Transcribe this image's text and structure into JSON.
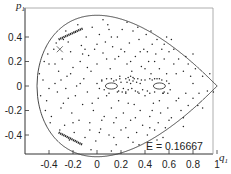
{
  "chart_data": {
    "type": "scatter",
    "title": "",
    "xlabel": "q1",
    "ylabel": "p1",
    "xlim": [
      -0.6,
      1.0
    ],
    "ylim": [
      -0.6,
      0.6
    ],
    "xticks": [
      -0.4,
      -0.2,
      0,
      0.2,
      0.4,
      0.6,
      0.8,
      1
    ],
    "xtick_labels": [
      "-0.4",
      "-0.2",
      "0",
      "0.2",
      "0.4",
      "0.6",
      "0.8",
      "1"
    ],
    "yticks": [
      0.4,
      0.2,
      0,
      -0.2,
      -0.4
    ],
    "ytick_labels": [
      "0.4",
      "0.2",
      "0",
      "-0.2",
      "-0.4"
    ],
    "grid": false,
    "legend": null,
    "annotation": {
      "text": "E = 0.16667",
      "x": 0.72,
      "y": -0.48
    },
    "energy": 0.16667,
    "boundary": "p1^2 = 2E - q1^2 + (2/3) q1^3, q1 in [-0.5, 1]",
    "series": [
      {
        "name": "chaotic-orbit-points",
        "points": [
          [
            -0.45,
            0.05
          ],
          [
            -0.42,
            -0.12
          ],
          [
            -0.4,
            0.18
          ],
          [
            -0.38,
            -0.25
          ],
          [
            -0.36,
            0.3
          ],
          [
            -0.35,
            0.02
          ],
          [
            -0.33,
            -0.05
          ],
          [
            -0.32,
            0.12
          ],
          [
            -0.3,
            -0.18
          ],
          [
            -0.29,
            0.22
          ],
          [
            -0.28,
            0.38
          ],
          [
            -0.27,
            -0.32
          ],
          [
            -0.25,
            0.08
          ],
          [
            -0.24,
            -0.1
          ],
          [
            -0.22,
            0.28
          ],
          [
            -0.21,
            -0.22
          ],
          [
            -0.2,
            0.15
          ],
          [
            -0.19,
            -0.38
          ],
          [
            -0.18,
            0.44
          ],
          [
            -0.17,
            0.0
          ],
          [
            -0.15,
            -0.28
          ],
          [
            -0.14,
            0.2
          ],
          [
            -0.13,
            0.33
          ],
          [
            -0.12,
            -0.15
          ],
          [
            -0.11,
            0.06
          ],
          [
            -0.1,
            -0.42
          ],
          [
            -0.09,
            0.4
          ],
          [
            -0.08,
            -0.05
          ],
          [
            -0.07,
            0.25
          ],
          [
            -0.06,
            -0.3
          ],
          [
            -0.05,
            0.12
          ],
          [
            -0.04,
            0.48
          ],
          [
            -0.03,
            -0.2
          ],
          [
            -0.02,
            0.3
          ],
          [
            -0.01,
            -0.45
          ],
          [
            0.0,
            0.18
          ],
          [
            0.01,
            -0.1
          ],
          [
            0.02,
            0.42
          ],
          [
            0.03,
            -0.35
          ],
          [
            0.04,
            0.05
          ],
          [
            0.05,
            0.27
          ],
          [
            0.06,
            -0.25
          ],
          [
            0.07,
            0.36
          ],
          [
            0.08,
            -0.08
          ],
          [
            0.09,
            0.5
          ],
          [
            0.1,
            -0.4
          ],
          [
            0.11,
            0.14
          ],
          [
            0.12,
            -0.18
          ],
          [
            0.13,
            0.32
          ],
          [
            0.14,
            -0.3
          ],
          [
            0.15,
            0.22
          ],
          [
            0.16,
            -0.48
          ],
          [
            0.17,
            0.4
          ],
          [
            0.18,
            -0.12
          ],
          [
            0.19,
            0.08
          ],
          [
            0.2,
            -0.36
          ],
          [
            0.21,
            0.46
          ],
          [
            0.22,
            -0.22
          ],
          [
            0.23,
            0.28
          ],
          [
            0.24,
            -0.05
          ],
          [
            0.25,
            0.18
          ],
          [
            0.26,
            -0.42
          ],
          [
            0.27,
            0.35
          ],
          [
            0.28,
            -0.28
          ],
          [
            0.29,
            0.12
          ],
          [
            0.3,
            0.45
          ],
          [
            0.31,
            -0.15
          ],
          [
            0.32,
            0.24
          ],
          [
            0.33,
            -0.38
          ],
          [
            0.34,
            0.06
          ],
          [
            0.35,
            0.38
          ],
          [
            0.36,
            -0.2
          ],
          [
            0.37,
            0.16
          ],
          [
            0.38,
            -0.32
          ],
          [
            0.39,
            0.3
          ],
          [
            0.4,
            -0.08
          ],
          [
            0.41,
            0.42
          ],
          [
            0.42,
            -0.4
          ],
          [
            0.43,
            0.2
          ],
          [
            0.44,
            -0.25
          ],
          [
            0.45,
            0.1
          ],
          [
            0.46,
            0.34
          ],
          [
            0.47,
            -0.14
          ],
          [
            0.48,
            -0.36
          ],
          [
            0.49,
            0.26
          ],
          [
            0.5,
            0.38
          ],
          [
            0.51,
            -0.3
          ],
          [
            0.52,
            0.14
          ],
          [
            0.53,
            -0.22
          ],
          [
            0.54,
            0.3
          ],
          [
            0.55,
            -0.06
          ],
          [
            0.56,
            0.22
          ],
          [
            0.57,
            -0.34
          ],
          [
            0.58,
            0.1
          ],
          [
            0.59,
            -0.18
          ],
          [
            0.6,
            0.28
          ],
          [
            0.62,
            -0.26
          ],
          [
            0.64,
            0.18
          ],
          [
            0.66,
            -0.12
          ],
          [
            0.68,
            0.22
          ],
          [
            0.7,
            -0.2
          ],
          [
            0.72,
            0.12
          ],
          [
            0.74,
            0.24
          ],
          [
            0.76,
            -0.16
          ],
          [
            0.78,
            0.08
          ],
          [
            0.8,
            -0.1
          ],
          [
            0.82,
            0.14
          ],
          [
            0.85,
            -0.06
          ],
          [
            0.88,
            0.08
          ],
          [
            0.92,
            -0.04
          ],
          [
            -0.48,
            0.1
          ],
          [
            -0.47,
            -0.08
          ],
          [
            -0.44,
            0.2
          ],
          [
            -0.43,
            -0.2
          ],
          [
            -0.41,
            0.26
          ],
          [
            -0.39,
            -0.3
          ],
          [
            -0.34,
            0.35
          ],
          [
            -0.31,
            -0.36
          ],
          [
            -0.26,
            0.45
          ],
          [
            -0.23,
            -0.44
          ],
          [
            -0.16,
            0.5
          ],
          [
            -0.05,
            -0.52
          ],
          [
            0.05,
            0.54
          ],
          [
            0.12,
            -0.53
          ],
          [
            0.25,
            0.52
          ],
          [
            0.35,
            -0.48
          ],
          [
            0.45,
            0.45
          ],
          [
            0.55,
            -0.42
          ],
          [
            0.62,
            0.38
          ],
          [
            0.72,
            -0.33
          ],
          [
            0.8,
            0.26
          ],
          [
            0.88,
            -0.18
          ],
          [
            0.94,
            0.1
          ],
          [
            0.97,
            -0.05
          ],
          [
            -0.3,
            0.05
          ],
          [
            -0.26,
            -0.02
          ],
          [
            -0.22,
            0.1
          ],
          [
            -0.18,
            -0.08
          ],
          [
            -0.14,
            0.02
          ],
          [
            -0.12,
            0.26
          ],
          [
            -0.08,
            0.15
          ],
          [
            -0.04,
            -0.14
          ],
          [
            0.0,
            0.34
          ],
          [
            0.04,
            -0.28
          ],
          [
            0.08,
            0.22
          ],
          [
            0.12,
            0.4
          ],
          [
            0.16,
            -0.26
          ],
          [
            0.2,
            0.3
          ],
          [
            0.24,
            -0.34
          ],
          [
            0.28,
            0.2
          ],
          [
            0.32,
            -0.26
          ],
          [
            0.36,
            0.28
          ],
          [
            0.4,
            0.14
          ],
          [
            0.44,
            -0.34
          ],
          [
            0.48,
            0.2
          ],
          [
            0.52,
            -0.12
          ],
          [
            0.56,
            0.34
          ],
          [
            0.6,
            -0.28
          ],
          [
            0.64,
            0.3
          ],
          [
            0.68,
            -0.1
          ],
          [
            0.72,
            -0.26
          ],
          [
            0.76,
            0.18
          ],
          [
            0.8,
            0.02
          ],
          [
            0.84,
            -0.16
          ],
          [
            -0.35,
            0.18
          ],
          [
            -0.28,
            -0.14
          ],
          [
            -0.2,
            -0.3
          ],
          [
            -0.1,
            0.3
          ],
          [
            0.02,
            -0.38
          ],
          [
            0.1,
            0.46
          ],
          [
            0.18,
            0.24
          ],
          [
            0.26,
            -0.14
          ],
          [
            0.34,
            0.48
          ],
          [
            0.42,
            0.28
          ],
          [
            0.5,
            -0.44
          ],
          [
            0.58,
            0.4
          ],
          [
            0.66,
            0.1
          ],
          [
            0.74,
            -0.06
          ],
          [
            -0.4,
            -0.02
          ],
          [
            -0.24,
            0.36
          ],
          [
            -0.06,
            -0.36
          ],
          [
            0.14,
            -0.42
          ],
          [
            0.3,
            -0.46
          ],
          [
            0.46,
            -0.2
          ]
        ]
      },
      {
        "name": "central-chain-points",
        "points": [
          [
            0.0,
            0.02
          ],
          [
            0.02,
            -0.02
          ],
          [
            0.04,
            0.04
          ],
          [
            0.06,
            -0.03
          ],
          [
            0.14,
            0.04
          ],
          [
            0.16,
            0.05
          ],
          [
            0.18,
            -0.04
          ],
          [
            0.2,
            0.03
          ],
          [
            0.22,
            -0.02
          ],
          [
            0.24,
            0.06
          ],
          [
            0.25,
            0.03
          ],
          [
            0.26,
            -0.03
          ],
          [
            0.27,
            0.05
          ],
          [
            0.28,
            0.02
          ],
          [
            0.29,
            -0.02
          ],
          [
            0.3,
            0.04
          ],
          [
            0.31,
            0.06
          ],
          [
            0.32,
            -0.04
          ],
          [
            0.33,
            0.03
          ],
          [
            0.34,
            -0.05
          ],
          [
            0.36,
            0.02
          ],
          [
            0.38,
            -0.03
          ],
          [
            0.4,
            0.05
          ],
          [
            0.42,
            -0.04
          ],
          [
            0.44,
            0.06
          ],
          [
            0.46,
            0.05
          ],
          [
            0.48,
            -0.05
          ],
          [
            0.5,
            0.06
          ],
          [
            0.52,
            0.06
          ],
          [
            0.54,
            0.05
          ],
          [
            0.56,
            -0.05
          ],
          [
            0.58,
            0.04
          ],
          [
            0.6,
            0.02
          ],
          [
            0.61,
            -0.03
          ],
          [
            0.17,
            -0.05
          ],
          [
            0.21,
            -0.05
          ],
          [
            0.19,
            0.06
          ],
          [
            0.08,
            0.06
          ],
          [
            0.1,
            -0.06
          ],
          [
            0.12,
            0.06
          ],
          [
            0.26,
            0.07
          ],
          [
            0.28,
            0.08
          ],
          [
            0.3,
            0.07
          ],
          [
            0.24,
            -0.06
          ],
          [
            0.35,
            -0.06
          ],
          [
            0.37,
            0.05
          ],
          [
            0.44,
            -0.06
          ],
          [
            0.48,
            0.06
          ],
          [
            0.55,
            -0.06
          ],
          [
            0.59,
            -0.06
          ]
        ]
      }
    ],
    "islands": [
      {
        "name": "upper-left-island",
        "q_from": -0.32,
        "p_from": 0.38,
        "q_to": -0.12,
        "p_to": 0.47
      },
      {
        "name": "lower-left-island",
        "q_from": -0.32,
        "p_from": -0.38,
        "q_to": -0.12,
        "p_to": -0.48
      },
      {
        "name": "left-center-ellipse",
        "cx": 0.12,
        "cy": 0.0,
        "rq": 0.05,
        "rp": 0.025
      },
      {
        "name": "right-center-ellipse",
        "cx": 0.52,
        "cy": 0.0,
        "rq": 0.05,
        "rp": 0.025
      },
      {
        "name": "small-cross-island",
        "cx": -0.31,
        "cy": 0.3
      }
    ]
  }
}
